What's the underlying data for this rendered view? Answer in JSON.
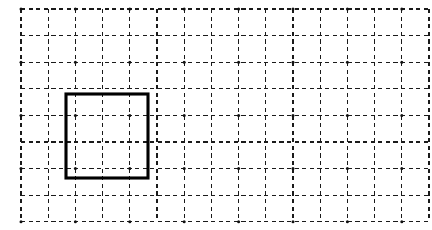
{
  "figure": {
    "title": "Dashed grid with a bold square outline",
    "width": 432,
    "height": 230,
    "background_color": "#ffffff"
  },
  "grid": {
    "name": "dashed-graph-grid",
    "origin_x": 21,
    "origin_y": 9,
    "cell_width": 27.2,
    "cell_height": 26.6,
    "columns": 15,
    "rows": 8,
    "line_color": "#1a1a1a",
    "line_style": "dashed",
    "line_width": 1.15,
    "dash_pattern": "4.2 3.4",
    "node_dots": true,
    "node_dot_color": "#111111",
    "node_dot_every": 2,
    "node_dot_radius": 1.5
  },
  "shapes": [
    {
      "name": "bold-square",
      "type": "square",
      "stroke_color": "#000000",
      "stroke_width": 3.1,
      "fill": "none",
      "x": 66,
      "y": 94,
      "width": 82,
      "height": 84,
      "grid_col_start": 2,
      "grid_row_start": 3,
      "grid_cells_wide": 3,
      "grid_cells_tall": 3,
      "area_in_cells": 9,
      "perimeter_in_cells": 12
    }
  ],
  "labels": {
    "none": ""
  }
}
